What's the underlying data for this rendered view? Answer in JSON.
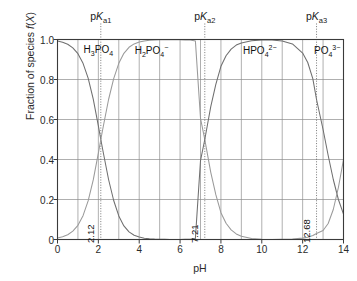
{
  "chart_data": {
    "type": "line",
    "title": "",
    "xlabel": "pH",
    "ylabel": "Fraction of species f(X)",
    "xlim": [
      0,
      14
    ],
    "ylim": [
      0,
      1.0
    ],
    "grid": true,
    "legend_position": "in-plot-annotations",
    "xticks": [
      "0",
      "2",
      "4",
      "6",
      "8",
      "10",
      "12",
      "14"
    ],
    "xtick_values": [
      0,
      2,
      4,
      6,
      8,
      10,
      12,
      14
    ],
    "yticks": [
      "0",
      "0.2",
      "0.4",
      "0.6",
      "0.8",
      "1.0"
    ],
    "ytick_values": [
      0,
      0.2,
      0.4,
      0.6,
      0.8,
      1.0
    ],
    "x_minor_step": 1,
    "pka_values": [
      2.12,
      7.21,
      12.68
    ],
    "pka_labels": [
      "2.12",
      "7.21",
      "12.68"
    ],
    "pka_top_labels": [
      "pKa1",
      "pKa2",
      "pKa3"
    ],
    "series": [
      {
        "name": "H3PO4",
        "label_html": "H<sub>3</sub>PO<sub>4</sub>",
        "label_x": 2.0,
        "color": "#6f6f6f"
      },
      {
        "name": "H2PO4-",
        "label_html": "H<sub>2</sub>PO<sub>4</sub><sup>&minus;</sup>",
        "label_x": 4.6,
        "color": "#9a9a9a"
      },
      {
        "name": "HPO42-",
        "label_html": "HPO<sub>4</sub><sup>2&minus;</sup>",
        "label_x": 9.9,
        "color": "#6f6f6f"
      },
      {
        "name": "PO43-",
        "label_html": "PO<sub>4</sub><sup>3&minus;</sup>",
        "label_x": 13.2,
        "color": "#9a9a9a"
      }
    ],
    "curve_points": {
      "x": [
        0,
        0.25,
        0.5,
        0.75,
        1,
        1.25,
        1.5,
        1.75,
        2,
        2.12,
        2.25,
        2.5,
        2.75,
        3,
        3.25,
        3.5,
        3.75,
        4,
        4.25,
        4.5,
        4.75,
        5,
        5.25,
        5.5,
        5.75,
        6,
        6.25,
        6.5,
        6.75,
        7,
        7.21,
        7.5,
        7.75,
        8,
        8.25,
        8.5,
        8.75,
        9,
        9.5,
        10,
        10.5,
        11,
        11.5,
        12,
        12.25,
        12.5,
        12.68,
        13,
        13.25,
        13.5,
        13.75,
        14
      ],
      "H3PO4": [
        0.992,
        0.986,
        0.976,
        0.958,
        0.929,
        0.881,
        0.807,
        0.702,
        0.568,
        0.5,
        0.43,
        0.3,
        0.195,
        0.118,
        0.068,
        0.038,
        0.021,
        0.012,
        0.0065,
        0.0036,
        0.002,
        0.0011,
        0.0006,
        0.00034,
        0.00019,
        0.0001,
        6e-05,
        3e-05,
        1e-05,
        1e-05,
        0,
        0,
        0,
        0,
        0,
        0,
        0,
        0,
        0,
        0,
        0,
        0,
        0,
        0,
        0,
        0,
        0,
        0,
        0,
        0,
        0,
        0
      ],
      "H2PO4-": [
        0.008,
        0.014,
        0.024,
        0.042,
        0.071,
        0.119,
        0.193,
        0.298,
        0.432,
        0.5,
        0.57,
        0.7,
        0.804,
        0.881,
        0.931,
        0.961,
        0.978,
        0.987,
        0.993,
        0.996,
        0.998,
        0.999,
        0.999,
        0.999,
        0.999,
        0.999,
        0.998,
        0.997,
        0.993,
        0.606,
        0.5,
        0.337,
        0.224,
        0.134,
        0.081,
        0.048,
        0.028,
        0.016,
        0.005,
        0.0016,
        0.0005,
        0.00016,
        5e-05,
        2e-05,
        1e-05,
        0,
        0,
        0,
        0,
        0,
        0,
        0
      ],
      "HPO42-": [
        0,
        0,
        0,
        0,
        0,
        0,
        0,
        0,
        0,
        0,
        0,
        0,
        0,
        0,
        0,
        0,
        0,
        0,
        0,
        0,
        1e-05,
        2e-05,
        3e-05,
        6e-05,
        0.0001,
        0.0003,
        0.0006,
        0.0013,
        0.0055,
        0.394,
        0.5,
        0.663,
        0.776,
        0.866,
        0.919,
        0.952,
        0.972,
        0.983,
        0.994,
        0.998,
        0.998,
        0.993,
        0.978,
        0.932,
        0.885,
        0.803,
        0.7,
        0.55,
        0.42,
        0.3,
        0.2,
        0.127
      ],
      "PO43-": [
        0,
        0,
        0,
        0,
        0,
        0,
        0,
        0,
        0,
        0,
        0,
        0,
        0,
        0,
        0,
        0,
        0,
        0,
        0,
        0,
        0,
        0,
        0,
        0,
        0,
        0,
        0,
        0,
        0,
        0,
        0,
        0,
        0,
        0,
        0,
        0,
        0,
        0,
        1e-05,
        5e-05,
        0.0002,
        0.0007,
        0.0022,
        0.0068,
        0.0115,
        0.0197,
        0.03,
        0.045,
        0.08,
        0.15,
        0.26,
        0.4
      ]
    }
  }
}
